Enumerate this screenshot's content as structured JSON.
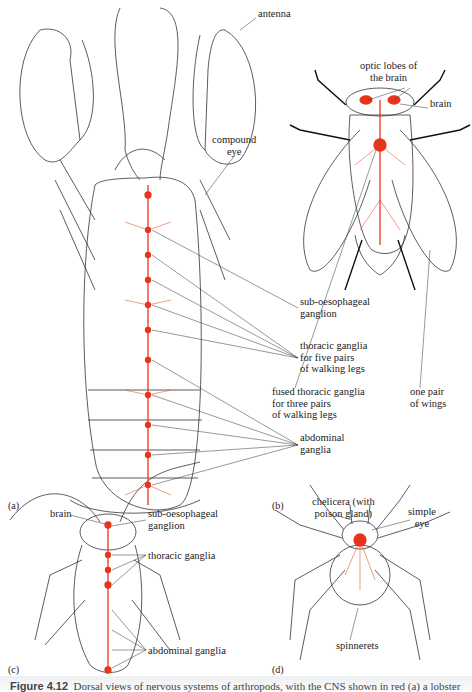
{
  "figure": {
    "panels": [
      {
        "id": "a",
        "tag": "(a)",
        "animal": "lobster",
        "labels": {
          "antenna": "antenna",
          "compound_eye": "compound\neye",
          "sub_oesophageal": "sub-oesophageal\nganglion",
          "thoracic": "thoracic ganglia\nfor five pairs\nof walking legs",
          "abdominal": "abdominal\nganglia"
        }
      },
      {
        "id": "b",
        "tag": "(b)",
        "animal": "fly",
        "labels": {
          "optic_lobes": "optic lobes of\nthe brain",
          "brain": "brain",
          "fused_thoracic": "fused thoracic ganglia\nfor three pairs\nof walking legs",
          "wings": "one pair\nof wings"
        }
      },
      {
        "id": "c",
        "tag": "(c)",
        "animal": "cockroach",
        "labels": {
          "brain": "brain",
          "sub_oesophageal": "sub-oesophageal\nganglion",
          "thoracic": "thoracic ganglia",
          "abdominal": "abdominal ganglia"
        }
      },
      {
        "id": "d",
        "tag": "(d)",
        "animal": "spider",
        "labels": {
          "chelicera": "chelicera (with\npoison gland)",
          "simple_eye": "simple\neye",
          "spinnerets": "spinnerets"
        }
      }
    ],
    "caption_number": "Figure 4.12",
    "caption_text": "Dorsal views of nervous systems of arthropods, with the CNS shown in red (a) a lobster"
  },
  "colors": {
    "nerve": "#e8341c",
    "outline": "#333333"
  }
}
